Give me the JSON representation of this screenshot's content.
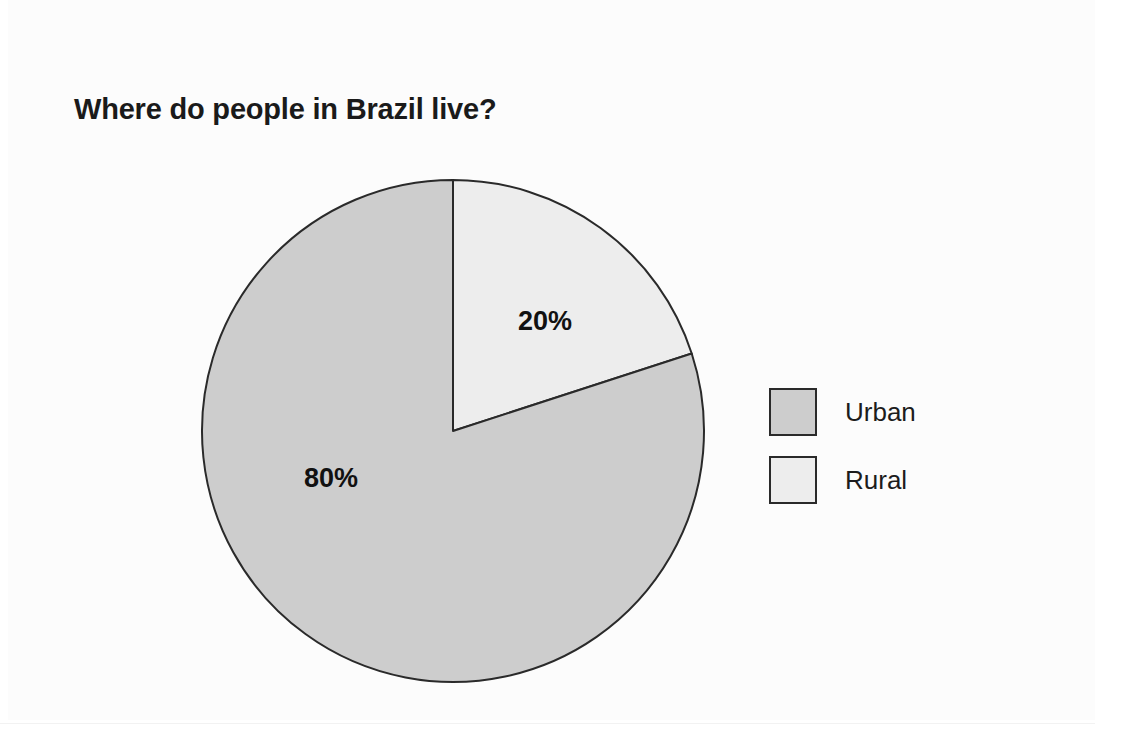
{
  "page": {
    "background_color": "#ffffff"
  },
  "chart_data": {
    "type": "pie",
    "title": "Where do people in Brazil live?",
    "xlabel": "",
    "ylabel": "",
    "categories": [
      "Urban",
      "Rural"
    ],
    "values": [
      80,
      20
    ],
    "value_labels": [
      "80%",
      "20%"
    ],
    "slice_colors": [
      "#cdcdcd",
      "#ededed"
    ],
    "slice_outline_color": "#2a2a2a",
    "start_angle_deg": 0,
    "direction": "clockwise",
    "legend": {
      "position": "right",
      "entries": [
        {
          "label": "Urban",
          "color": "#cdcdcd"
        },
        {
          "label": "Rural",
          "color": "#ededed"
        }
      ]
    },
    "grid": false,
    "annotations": [
      {
        "text": "20%",
        "slice": "Rural"
      },
      {
        "text": "80%",
        "slice": "Urban"
      }
    ]
  }
}
